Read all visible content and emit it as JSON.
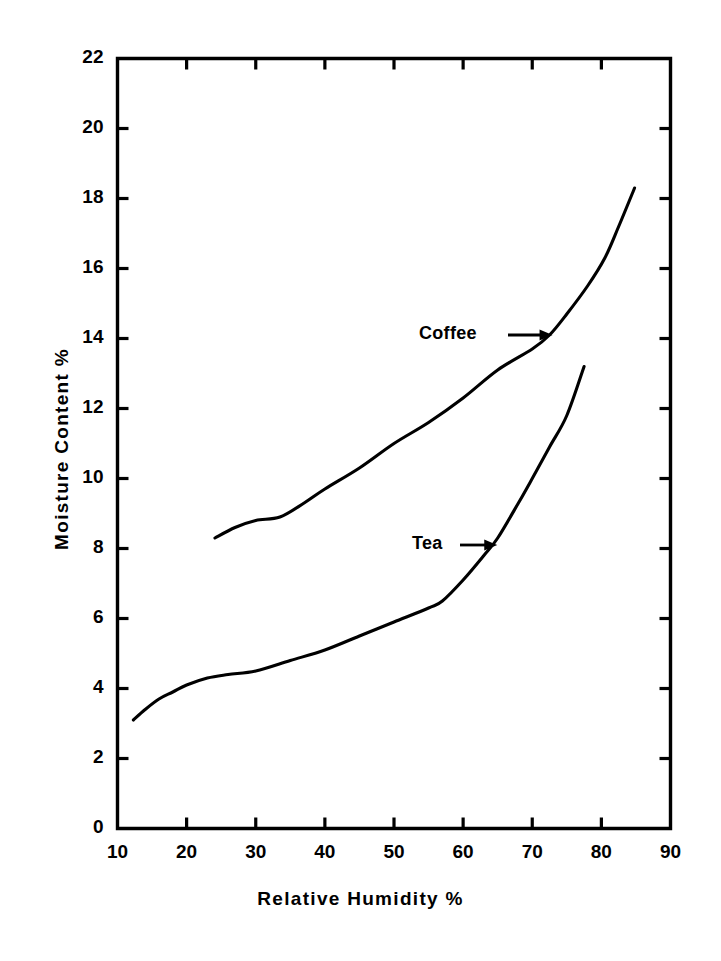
{
  "chart_data": {
    "type": "line",
    "title": "",
    "xlabel": "Relative  Humidity  %",
    "ylabel": "Moisture  Content  %",
    "xlim": [
      10,
      90
    ],
    "ylim": [
      0,
      22
    ],
    "xticks": [
      10,
      20,
      30,
      40,
      50,
      60,
      70,
      80,
      90
    ],
    "yticks": [
      0,
      2,
      4,
      6,
      8,
      10,
      12,
      14,
      16,
      18,
      20,
      22
    ],
    "xticklabels": [
      "10",
      "20",
      "30",
      "40",
      "50",
      "60",
      "70",
      "80",
      "90"
    ],
    "yticklabels": [
      "0",
      "2",
      "4",
      "6",
      "8",
      "10",
      "12",
      "14",
      "16",
      "18",
      "20",
      "22"
    ],
    "grid": false,
    "legend": "inline annotations with arrows",
    "series": [
      {
        "name": "Coffee",
        "label_position": "above-left of curve at 72 RH",
        "points": [
          [
            24.1,
            8.3
          ],
          [
            27.0,
            8.6
          ],
          [
            30.0,
            8.8
          ],
          [
            33.5,
            8.9
          ],
          [
            37.0,
            9.3
          ],
          [
            40.0,
            9.7
          ],
          [
            45.0,
            10.3
          ],
          [
            50.0,
            11.0
          ],
          [
            55.0,
            11.6
          ],
          [
            60.0,
            12.3
          ],
          [
            65.0,
            13.1
          ],
          [
            70.0,
            13.7
          ],
          [
            72.5,
            14.1
          ],
          [
            75.0,
            14.7
          ],
          [
            78.0,
            15.5
          ],
          [
            80.5,
            16.3
          ],
          [
            82.5,
            17.2
          ],
          [
            84.8,
            18.3
          ]
        ]
      },
      {
        "name": "Tea",
        "label_position": "left of curve at 64 RH",
        "points": [
          [
            12.3,
            3.1
          ],
          [
            14.0,
            3.4
          ],
          [
            16.0,
            3.7
          ],
          [
            18.0,
            3.9
          ],
          [
            20.0,
            4.1
          ],
          [
            23.0,
            4.3
          ],
          [
            26.0,
            4.4
          ],
          [
            30.0,
            4.5
          ],
          [
            35.0,
            4.8
          ],
          [
            40.0,
            5.1
          ],
          [
            45.0,
            5.5
          ],
          [
            50.0,
            5.9
          ],
          [
            55.0,
            6.3
          ],
          [
            57.0,
            6.5
          ],
          [
            60.0,
            7.1
          ],
          [
            63.0,
            7.8
          ],
          [
            65.0,
            8.3
          ],
          [
            68.0,
            9.3
          ],
          [
            70.0,
            10.0
          ],
          [
            72.5,
            10.9
          ],
          [
            75.0,
            11.8
          ],
          [
            77.5,
            13.2
          ]
        ]
      }
    ],
    "annotations": [
      {
        "text": "Coffee",
        "arrow_to": [
          72.5,
          14.1
        ]
      },
      {
        "text": "Tea",
        "arrow_to": [
          64.5,
          8.1
        ]
      }
    ]
  }
}
